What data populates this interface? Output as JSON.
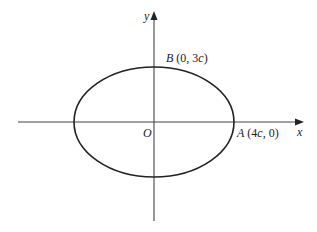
{
  "diagram": {
    "type": "ellipse-on-axes",
    "axes": {
      "x_label": "x",
      "y_label": "y",
      "origin_label": "O"
    },
    "points": [
      {
        "name": "B",
        "coords": "(0, 3c)",
        "x": "0",
        "y": "3c"
      },
      {
        "name": "A",
        "coords": "(4c, 0)",
        "x": "4c",
        "y": "0"
      }
    ],
    "colors": {
      "curve": "#222222",
      "axes": "#444444"
    }
  },
  "labels": {
    "x": "x",
    "y": "y",
    "origin": "O",
    "B_name": "B",
    "B_open": " (0, 3",
    "B_c": "c",
    "B_close": ")",
    "A_name": "A",
    "A_open": " (4",
    "A_c": "c",
    "A_close": ", 0)"
  }
}
